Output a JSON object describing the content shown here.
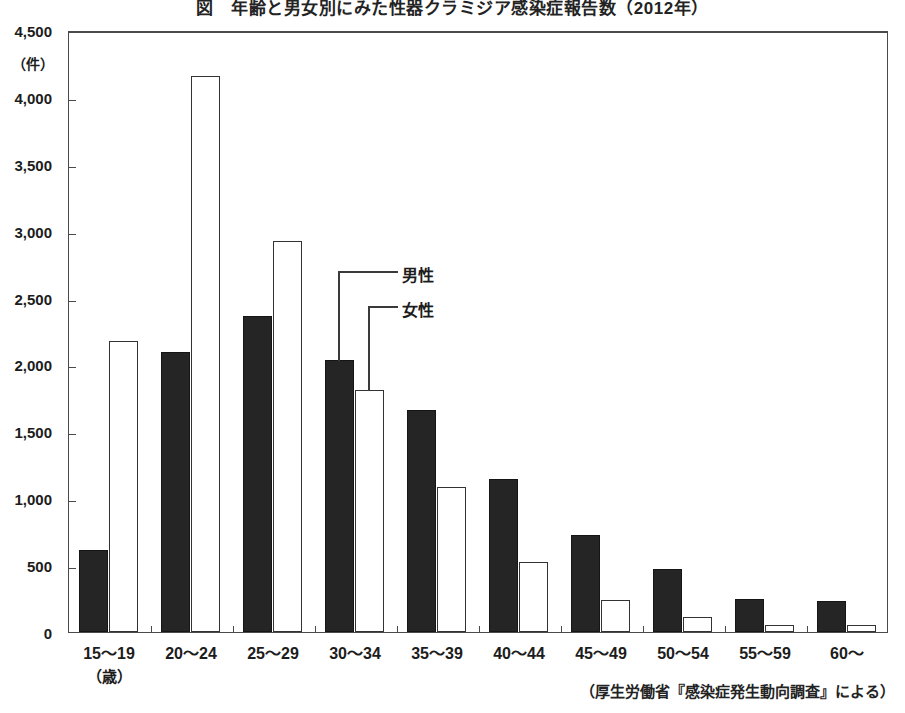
{
  "chart_data": {
    "type": "bar",
    "title": "図　年齢と男女別にみた性器クラミジア感染症報告数（2012年）",
    "xlabel": "（歳）",
    "ylabel": "（件）",
    "categories": [
      "15〜19",
      "20〜24",
      "25〜29",
      "30〜34",
      "35〜39",
      "40〜44",
      "45〜49",
      "50〜54",
      "55〜59",
      "60〜"
    ],
    "series": [
      {
        "name": "男性",
        "fill": "#252525",
        "values": [
          613,
          2090,
          2365,
          2035,
          1660,
          1145,
          725,
          470,
          250,
          235
        ]
      },
      {
        "name": "女性",
        "fill": "#ffffff",
        "values": [
          2175,
          4160,
          2920,
          1810,
          1085,
          520,
          240,
          110,
          50,
          55
        ]
      }
    ],
    "ylim": [
      0,
      4500
    ],
    "y_ticks": [
      0,
      500,
      1000,
      1500,
      2000,
      2500,
      3000,
      3500,
      4000,
      4500
    ],
    "y_tick_labels": [
      "0",
      "500",
      "1,000",
      "1,500",
      "2,000",
      "2,500",
      "3,000",
      "3,500",
      "4,000",
      "4,500"
    ],
    "grid": false,
    "legend_position": "inside-callout",
    "annotations": [
      {
        "label": "男性",
        "target_series": "男性",
        "target_category": "30〜34"
      },
      {
        "label": "女性",
        "target_series": "女性",
        "target_category": "30〜34"
      }
    ]
  },
  "source_note": "（厚生労働省『感染症発生動向調査』による）"
}
